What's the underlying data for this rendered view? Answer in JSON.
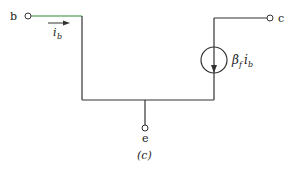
{
  "diagram": {
    "type": "circuit-schematic",
    "caption": "(c)",
    "terminals": {
      "base": "b",
      "collector": "c",
      "emitter": "e"
    },
    "currents": {
      "base_current": "i",
      "base_current_sub": "b",
      "source_coeff": "β",
      "source_coeff_sub": "f",
      "source_var": "i",
      "source_var_sub": "b"
    },
    "colors": {
      "wire": "#333333",
      "base_wire": "#2e8b2e",
      "source_circle": "#333333"
    }
  }
}
